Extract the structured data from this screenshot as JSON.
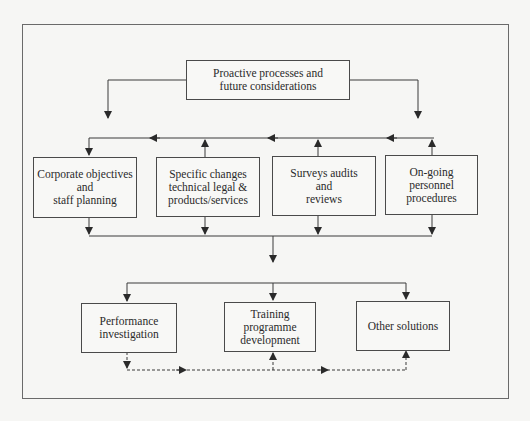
{
  "diagram": {
    "title": "",
    "nodes": {
      "top": {
        "label": "Proactive processes and\nfuture considerations"
      },
      "middle": [
        {
          "id": "corporate",
          "label": "Corporate objectives\nand\nstaff planning"
        },
        {
          "id": "specific",
          "label": "Specific changes\ntechnical legal &\nproducts/services"
        },
        {
          "id": "surveys",
          "label": "Surveys audits\nand\nreviews"
        },
        {
          "id": "ongoing",
          "label": "On-going\npersonnel\nprocedures"
        }
      ],
      "bottom": [
        {
          "id": "performance",
          "label": "Performance\ninvestigation"
        },
        {
          "id": "training",
          "label": "Training\nprogramme\ndevelopment"
        },
        {
          "id": "other",
          "label": "Other solutions"
        }
      ]
    },
    "edges": [
      {
        "from": "top",
        "to": "corporate",
        "style": "solid"
      },
      {
        "from": "top",
        "to": "ongoing",
        "style": "solid"
      },
      {
        "from": "specific",
        "to": "top-bus",
        "style": "solid"
      },
      {
        "from": "surveys",
        "to": "top-bus",
        "style": "solid"
      },
      {
        "from": "ongoing",
        "to": "top-bus",
        "style": "solid"
      },
      {
        "from": "middle",
        "to": "bottom-bus",
        "style": "solid"
      },
      {
        "from": "bottom-bus",
        "to": "performance",
        "style": "solid"
      },
      {
        "from": "bottom-bus",
        "to": "training",
        "style": "solid"
      },
      {
        "from": "bottom-bus",
        "to": "other",
        "style": "solid"
      },
      {
        "from": "performance",
        "to": "training",
        "style": "dashed"
      },
      {
        "from": "performance",
        "to": "other",
        "style": "dashed"
      }
    ],
    "colors": {
      "line": "#3a3a3a",
      "background": "#f6f6f4",
      "frame": "#6a6a6a"
    }
  }
}
